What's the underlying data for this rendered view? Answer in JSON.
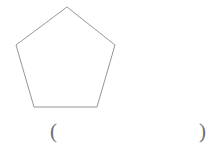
{
  "page": {
    "background_color": "#ffffff",
    "width": 219,
    "height": 153
  },
  "figure": {
    "name": "regular-pentagon",
    "shape_label": "pentagon",
    "stroke_color": "#8a8a8a",
    "fill_color": "#ffffff",
    "stroke_width": 0.9,
    "vertices": [
      {
        "x": 67,
        "y": 7
      },
      {
        "x": 115,
        "y": 45
      },
      {
        "x": 97,
        "y": 107
      },
      {
        "x": 34,
        "y": 107
      },
      {
        "x": 16,
        "y": 45
      }
    ],
    "points_attr": "67,7 115,45 97,107 34,107 16,45",
    "side_count": 5
  },
  "answer": {
    "paren_open": "(",
    "paren_close": ")",
    "value": "",
    "placeholder": ""
  }
}
